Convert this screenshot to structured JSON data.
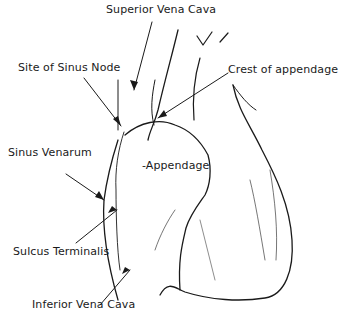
{
  "figure": {
    "labels": {
      "superior_vena_cava": "Superior Vena Cava",
      "site_of_sinus_node": "Site of Sinus Node",
      "crest_of_appendage": "Crest of appendage",
      "sinus_venarum": "Sinus Venarum",
      "appendage": "-Appendage",
      "sulcus_terminalis": "Sulcus Terminalis",
      "inferior_vena_cava": "Inferior Vena Cava"
    },
    "colors": {
      "ink": "#1a1a1a",
      "background": "#ffffff"
    }
  }
}
